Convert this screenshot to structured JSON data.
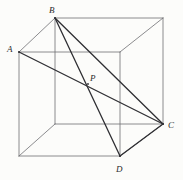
{
  "figure": {
    "background_color": "#fcfcfa",
    "edge_color": "#6e6e72",
    "diagonal_color": "#2f2f33",
    "label_color": "#2b2b2b",
    "edge_width": 0.8,
    "diagonal_width": 1.3,
    "width": 183,
    "height": 180
  },
  "labels": {
    "a": "A",
    "b": "B",
    "c": "C",
    "d": "D",
    "p": "P"
  },
  "chart_data": {
    "type": "diagram",
    "projection": "oblique cabinet projection",
    "depth_offset": {
      "dx": 36,
      "dy": -34
    },
    "points": {
      "A": {
        "x": 19,
        "y": 52,
        "role": "front-top-left",
        "labeled": true
      },
      "FTR": {
        "x": 120,
        "y": 52,
        "role": "front-top-right",
        "labeled": false
      },
      "FBL": {
        "x": 19,
        "y": 156,
        "role": "front-bottom-left",
        "labeled": false
      },
      "D": {
        "x": 120,
        "y": 156,
        "role": "front-bottom-right",
        "labeled": true
      },
      "B": {
        "x": 55,
        "y": 18,
        "role": "back-top-left",
        "labeled": true
      },
      "BTR": {
        "x": 163,
        "y": 18,
        "role": "back-top-right",
        "labeled": false
      },
      "BBL": {
        "x": 55,
        "y": 124,
        "role": "back-bottom-left",
        "labeled": false
      },
      "C": {
        "x": 163,
        "y": 124,
        "role": "back-bottom-right",
        "labeled": true
      },
      "P": {
        "x": 88,
        "y": 84,
        "role": "intersection-of-AC-and-BD",
        "labeled": true
      }
    },
    "edges": [
      {
        "from": "A",
        "to": "FTR",
        "kind": "cube-edge"
      },
      {
        "from": "FTR",
        "to": "D",
        "kind": "cube-edge"
      },
      {
        "from": "D",
        "to": "FBL",
        "kind": "cube-edge"
      },
      {
        "from": "FBL",
        "to": "A",
        "kind": "cube-edge"
      },
      {
        "from": "B",
        "to": "BTR",
        "kind": "cube-edge"
      },
      {
        "from": "BTR",
        "to": "C",
        "kind": "cube-edge"
      },
      {
        "from": "C",
        "to": "BBL",
        "kind": "cube-edge"
      },
      {
        "from": "BBL",
        "to": "B",
        "kind": "cube-edge"
      },
      {
        "from": "A",
        "to": "B",
        "kind": "cube-edge"
      },
      {
        "from": "FTR",
        "to": "BTR",
        "kind": "cube-edge"
      },
      {
        "from": "D",
        "to": "C",
        "kind": "cube-edge"
      },
      {
        "from": "FBL",
        "to": "BBL",
        "kind": "cube-edge"
      }
    ],
    "diagonals": [
      {
        "from": "A",
        "to": "C",
        "kind": "space-diagonal",
        "emphasis": "bold"
      },
      {
        "from": "B",
        "to": "D",
        "kind": "space-diagonal",
        "emphasis": "bold"
      },
      {
        "from": "B",
        "to": "C",
        "kind": "face-diagonal",
        "emphasis": "bold"
      },
      {
        "from": "C",
        "to": "D",
        "kind": "face-diagonal",
        "emphasis": "bold"
      }
    ],
    "label_positions": {
      "A": {
        "x": 7,
        "y": 45
      },
      "B": {
        "x": 49,
        "y": 6
      },
      "C": {
        "x": 168,
        "y": 121
      },
      "D": {
        "x": 116,
        "y": 165
      },
      "P": {
        "x": 90,
        "y": 74
      }
    }
  }
}
